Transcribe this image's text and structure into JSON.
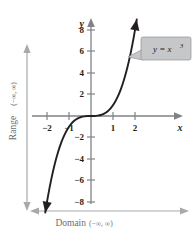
{
  "figure": {
    "name": "cubic-function-graph",
    "background_color": "#ffffff",
    "curve_color": "#231f20",
    "axis_color": "#808285",
    "guide_color": "#a7a9ac",
    "callout_fill": "#c6c7c9",
    "callout_border": "#929497"
  },
  "axes": {
    "x_name": "x",
    "y_name": "y",
    "x_ticks": [
      {
        "value": -2,
        "label": "−2"
      },
      {
        "value": -1,
        "label": "−1"
      },
      {
        "value": 1,
        "label": "1"
      },
      {
        "value": 2,
        "label": "2"
      }
    ],
    "y_ticks": [
      {
        "value": 8,
        "label": "8"
      },
      {
        "value": 6,
        "label": "6"
      },
      {
        "value": 4,
        "label": "4"
      },
      {
        "value": 2,
        "label": "2"
      },
      {
        "value": -2,
        "label": "−2"
      },
      {
        "value": -4,
        "label": "−4"
      },
      {
        "value": -6,
        "label": "−6"
      },
      {
        "value": -8,
        "label": "−8"
      }
    ]
  },
  "callout": {
    "equation_base": "y = x",
    "equation_exponent": "3"
  },
  "annotations": {
    "domain_label": "Domain",
    "domain_interval": "(−∞, ∞)",
    "range_label": "Range",
    "range_interval": "(−∞, ∞)"
  },
  "chart_data": {
    "type": "line",
    "title": "",
    "xlabel": "x",
    "ylabel": "y",
    "xlim": [
      -2.2,
      2.2
    ],
    "ylim": [
      -9,
      9
    ],
    "grid": false,
    "legend": "none",
    "series": [
      {
        "name": "y = x^3",
        "expression": "x^3",
        "arrow_start": true,
        "arrow_end": true,
        "x": [
          -2.08,
          -1.95,
          -1.8,
          -1.65,
          -1.5,
          -1.35,
          -1.2,
          -1.05,
          -0.9,
          -0.75,
          -0.6,
          -0.45,
          -0.3,
          -0.15,
          0,
          0.15,
          0.3,
          0.45,
          0.6,
          0.75,
          0.9,
          1.05,
          1.2,
          1.35,
          1.5,
          1.65,
          1.8,
          1.95,
          2.08
        ],
        "y": [
          -8.99,
          -7.41,
          -5.83,
          -4.49,
          -3.38,
          -2.46,
          -1.73,
          -1.16,
          -0.73,
          -0.42,
          -0.22,
          -0.09,
          -0.03,
          0.0,
          0,
          0.0,
          0.03,
          0.09,
          0.22,
          0.42,
          0.73,
          1.16,
          1.73,
          2.46,
          3.38,
          4.49,
          5.83,
          7.41,
          8.99
        ]
      }
    ]
  }
}
